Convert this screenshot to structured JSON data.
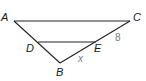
{
  "diagram": {
    "type": "geometry-triangle",
    "colors": {
      "line": "#222222",
      "label": "#1a1a1a",
      "measure": "#7a7a7a",
      "background": "#ffffff"
    },
    "points": {
      "A": {
        "label": "A",
        "x": 14,
        "y": 21
      },
      "C": {
        "label": "C",
        "x": 130,
        "y": 21
      },
      "D": {
        "label": "D",
        "x": 38,
        "y": 42
      },
      "E": {
        "label": "E",
        "x": 96,
        "y": 42
      },
      "B": {
        "label": "B",
        "x": 60,
        "y": 63
      }
    },
    "segments": [
      "AC",
      "AB",
      "CB",
      "DE"
    ],
    "measures": {
      "CE": "8",
      "EB": "x"
    }
  }
}
